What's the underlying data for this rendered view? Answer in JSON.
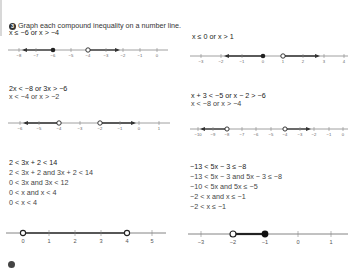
{
  "header": {
    "number": "3",
    "instruction": "Graph each compound inequality on a number line."
  },
  "problems": [
    {
      "id": "p1",
      "lines": [
        "x ≤ −6 or x > −4"
      ],
      "number_line": {
        "ticks": [
          "−8",
          "−7",
          "−6",
          "−5",
          "−4",
          "−3",
          "−2",
          "−1",
          "0"
        ],
        "points": [
          {
            "value": "−6",
            "type": "closed"
          },
          {
            "value": "−4",
            "type": "open"
          }
        ],
        "rays": [
          "left from −6",
          "right from −4"
        ]
      }
    },
    {
      "id": "p2",
      "lines": [
        "x ≤ 0 or x > 1"
      ],
      "number_line": {
        "ticks": [
          "−3",
          "−2",
          "−1",
          "0",
          "1",
          "2",
          "3",
          "4"
        ],
        "points": [
          {
            "value": "0",
            "type": "closed"
          },
          {
            "value": "1",
            "type": "open"
          }
        ],
        "rays": [
          "left from 0",
          "right from 1"
        ]
      }
    },
    {
      "id": "p3",
      "lines": [
        "2x < −8 or 3x > −6",
        "x < −4 or x > −2"
      ],
      "number_line": {
        "ticks": [
          "−6",
          "−5",
          "−4",
          "−3",
          "−2",
          "−1",
          "0",
          "1"
        ],
        "points": [
          {
            "value": "−4",
            "type": "open"
          },
          {
            "value": "−2",
            "type": "open"
          }
        ],
        "rays": [
          "left from −4",
          "right from −2"
        ]
      }
    },
    {
      "id": "p4",
      "lines": [
        "x + 3 < −5 or x − 2 > −6",
        "x < −8 or x > −4"
      ],
      "number_line": {
        "ticks": [
          "−10",
          "−9",
          "−8",
          "−7",
          "−6",
          "−5",
          "−4",
          "−3",
          "−2",
          "−1",
          "0"
        ],
        "points": [
          {
            "value": "−8",
            "type": "open"
          },
          {
            "value": "−4",
            "type": "open"
          }
        ],
        "rays": [
          "left from −8",
          "right from −4"
        ]
      }
    },
    {
      "id": "p5",
      "lines": [
        "2 < 3x + 2 < 14",
        "2 < 3x + 2 and 3x + 2 < 14",
        "0 < 3x and 3x < 12",
        "0 < x and x < 4",
        "0 < x < 4"
      ],
      "number_line": {
        "ticks": [
          "0",
          "1",
          "2",
          "3",
          "4",
          "5"
        ],
        "points": [
          {
            "value": "0",
            "type": "open"
          },
          {
            "value": "4",
            "type": "open"
          }
        ],
        "segment": "0 to 4"
      }
    },
    {
      "id": "p6",
      "lines": [
        "−13 < 5x − 3 ≤ −8",
        "−13 < 5x − 3 and 5x − 3 ≤ −8",
        "−10 < 5x and 5x ≤ −5",
        "−2 < x and x ≤ −1",
        "−2 < x ≤ −1"
      ],
      "number_line": {
        "ticks": [
          "−3",
          "−2",
          "−1",
          "0",
          "1"
        ],
        "points": [
          {
            "value": "−2",
            "type": "open"
          },
          {
            "value": "−1",
            "type": "closed"
          }
        ],
        "segment": "−2 to −1"
      }
    }
  ]
}
